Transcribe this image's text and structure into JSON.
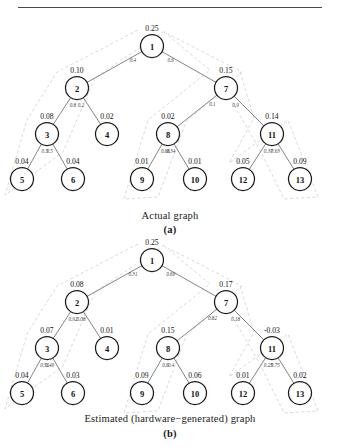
{
  "figure": {
    "divider": "horizontal-rule",
    "panels": [
      {
        "id": "a",
        "caption_title": "Actual graph",
        "caption_label": "(a)"
      },
      {
        "id": "b",
        "caption_title": "Estimated (hardware−generated) graph",
        "caption_label": "(b)"
      }
    ]
  },
  "chart_data": {
    "type": "diagram",
    "graphs": [
      {
        "name": "actual",
        "caption": "Actual graph",
        "label": "(a)",
        "nodes": [
          {
            "id": "1",
            "value": "0.25"
          },
          {
            "id": "2",
            "value": "0.10"
          },
          {
            "id": "3",
            "value": "0.08"
          },
          {
            "id": "4",
            "value": "0.02"
          },
          {
            "id": "5",
            "value": "0.04"
          },
          {
            "id": "6",
            "value": "0.04"
          },
          {
            "id": "7",
            "value": "0.15"
          },
          {
            "id": "8",
            "value": "0.02"
          },
          {
            "id": "9",
            "value": "0.01"
          },
          {
            "id": "10",
            "value": "0.01"
          },
          {
            "id": "11",
            "value": "0.14"
          },
          {
            "id": "12",
            "value": "0.05"
          },
          {
            "id": "13",
            "value": "0.09"
          }
        ],
        "edges": [
          {
            "from": "1",
            "to": "2",
            "weight": "0.4"
          },
          {
            "from": "1",
            "to": "7",
            "weight": "0.6"
          },
          {
            "from": "2",
            "to": "3",
            "weight": "0.8"
          },
          {
            "from": "2",
            "to": "4",
            "weight": "0.2"
          },
          {
            "from": "3",
            "to": "5",
            "weight": "0.5"
          },
          {
            "from": "3",
            "to": "6",
            "weight": "0.5"
          },
          {
            "from": "7",
            "to": "8",
            "weight": "0.1"
          },
          {
            "from": "7",
            "to": "11",
            "weight": "0.9"
          },
          {
            "from": "8",
            "to": "9",
            "weight": "0.66"
          },
          {
            "from": "8",
            "to": "10",
            "weight": "0.34"
          },
          {
            "from": "11",
            "to": "12",
            "weight": "0.37"
          },
          {
            "from": "11",
            "to": "13",
            "weight": "0.63"
          }
        ]
      },
      {
        "name": "estimated",
        "caption": "Estimated (hardware−generated) graph",
        "label": "(b)",
        "nodes": [
          {
            "id": "1",
            "value": "0.25"
          },
          {
            "id": "2",
            "value": "0.08"
          },
          {
            "id": "3",
            "value": "0.07"
          },
          {
            "id": "4",
            "value": "0.01"
          },
          {
            "id": "5",
            "value": "0.04"
          },
          {
            "id": "6",
            "value": "0.03"
          },
          {
            "id": "7",
            "value": "0.17"
          },
          {
            "id": "8",
            "value": "0.15"
          },
          {
            "id": "9",
            "value": "0.09"
          },
          {
            "id": "10",
            "value": "0.06"
          },
          {
            "id": "11",
            "value": "-0.03"
          },
          {
            "id": "12",
            "value": "0.01"
          },
          {
            "id": "13",
            "value": "0.02"
          }
        ],
        "edges": [
          {
            "from": "1",
            "to": "2",
            "weight": "0.31"
          },
          {
            "from": "1",
            "to": "7",
            "weight": "0.69"
          },
          {
            "from": "2",
            "to": "3",
            "weight": "0.92"
          },
          {
            "from": "2",
            "to": "4",
            "weight": "0.08"
          },
          {
            "from": "3",
            "to": "5",
            "weight": "0.51"
          },
          {
            "from": "3",
            "to": "6",
            "weight": "0.49"
          },
          {
            "from": "7",
            "to": "8",
            "weight": "0.82"
          },
          {
            "from": "7",
            "to": "11",
            "weight": "0.18"
          },
          {
            "from": "8",
            "to": "9",
            "weight": "0.6"
          },
          {
            "from": "8",
            "to": "10",
            "weight": "0.4"
          },
          {
            "from": "11",
            "to": "12",
            "weight": "0.25"
          },
          {
            "from": "11",
            "to": "13",
            "weight": "0.75"
          }
        ]
      }
    ],
    "colors": {
      "node_stroke": "#1b1b1b",
      "edge": "#6e6e6e",
      "halo": "#c9c9c9",
      "text": "#111111",
      "background": "#ffffff"
    }
  }
}
